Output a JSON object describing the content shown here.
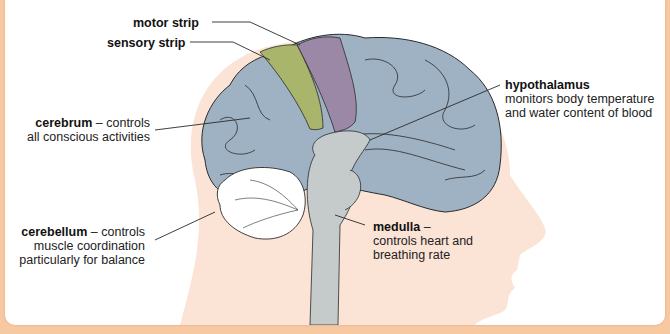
{
  "labels": {
    "motor_strip": {
      "name": "motor strip",
      "desc": ""
    },
    "sensory_strip": {
      "name": "sensory strip",
      "desc": ""
    },
    "cerebrum": {
      "name": "cerebrum",
      "dash": " – controls",
      "line2": "all conscious activities"
    },
    "cerebellum": {
      "name": "cerebellum",
      "dash": " – controls",
      "line2": "muscle coordination",
      "line3": "particularly for balance"
    },
    "hypothalamus": {
      "name": "hypothalamus",
      "line2": "monitors body temperature",
      "line3": "and water content of blood"
    },
    "medulla": {
      "name": "medulla",
      "dash": " –",
      "line2": "controls heart and",
      "line3": "breathing rate"
    }
  },
  "colors": {
    "frame": "#f7c9a3",
    "head": "#fbe3d6",
    "cerebrum": "#9fb2c3",
    "motor_strip": "#9a88a6",
    "sensory_strip": "#a9b56a",
    "brainstem": "#c5cacb",
    "cerebellum": "#ffffff",
    "outline": "#2a2a2a"
  }
}
